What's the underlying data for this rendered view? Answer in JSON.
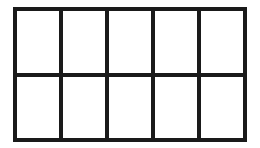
{
  "grid": {
    "rows": 2,
    "columns": 5,
    "line_color": "#1a1a1a",
    "cell_color": "#ffffff",
    "cells": [
      {
        "row": 1,
        "col": 1
      },
      {
        "row": 1,
        "col": 2
      },
      {
        "row": 1,
        "col": 3
      },
      {
        "row": 1,
        "col": 4
      },
      {
        "row": 1,
        "col": 5
      },
      {
        "row": 2,
        "col": 1
      },
      {
        "row": 2,
        "col": 2
      },
      {
        "row": 2,
        "col": 3
      },
      {
        "row": 2,
        "col": 4
      },
      {
        "row": 2,
        "col": 5
      }
    ]
  }
}
